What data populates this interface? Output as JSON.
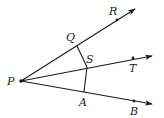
{
  "diagram": {
    "type": "geometry-rays",
    "vertex": {
      "label": "P",
      "x": 21,
      "y": 81
    },
    "rays": [
      {
        "name": "ray-PR",
        "through": "R",
        "end": {
          "x": 135,
          "y": 9
        }
      },
      {
        "name": "ray-PT",
        "through": "T",
        "end": {
          "x": 152,
          "y": 56
        }
      },
      {
        "name": "ray-PB",
        "through": "B",
        "end": {
          "x": 152,
          "y": 104
        }
      }
    ],
    "points": [
      {
        "label": "P",
        "x": 21,
        "y": 81,
        "lx": 7,
        "ly": 85
      },
      {
        "label": "Q",
        "x": 77,
        "y": 46,
        "lx": 66,
        "ly": 41
      },
      {
        "label": "R",
        "x": 117,
        "y": 20,
        "lx": 109,
        "ly": 15
      },
      {
        "label": "S",
        "x": 87,
        "y": 67,
        "lx": 86,
        "ly": 63
      },
      {
        "label": "T",
        "x": 133,
        "y": 58,
        "lx": 129,
        "ly": 72
      },
      {
        "label": "A",
        "x": 84,
        "y": 92,
        "lx": 79,
        "ly": 106
      },
      {
        "label": "B",
        "x": 134,
        "y": 101,
        "lx": 130,
        "ly": 115
      }
    ],
    "segments": [
      {
        "from": "Q",
        "to": "S"
      },
      {
        "from": "S",
        "to": "A"
      }
    ],
    "colors": {
      "stroke": "#1a1a1a",
      "background": "#ffffff"
    }
  }
}
